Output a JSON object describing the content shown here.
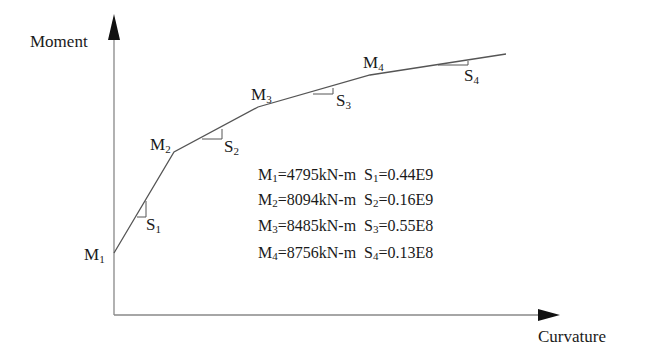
{
  "diagram": {
    "axes": {
      "y_label": "Moment",
      "x_label": "Curvature"
    },
    "points": [
      {
        "id": "M1",
        "label": "M",
        "sub": "1"
      },
      {
        "id": "M2",
        "label": "M",
        "sub": "2"
      },
      {
        "id": "M3",
        "label": "M",
        "sub": "3"
      },
      {
        "id": "M4",
        "label": "M",
        "sub": "4"
      }
    ],
    "slopes": [
      {
        "id": "S1",
        "label": "S",
        "sub": "1"
      },
      {
        "id": "S2",
        "label": "S",
        "sub": "2"
      },
      {
        "id": "S3",
        "label": "S",
        "sub": "3"
      },
      {
        "id": "S4",
        "label": "S",
        "sub": "4"
      }
    ],
    "legend": [
      {
        "m_sub": "1",
        "m_value": "=4795kN-m",
        "s_sub": "1",
        "s_value": "=0.44E9"
      },
      {
        "m_sub": "2",
        "m_value": "=8094kN-m",
        "s_sub": "2",
        "s_value": "=0.16E9"
      },
      {
        "m_sub": "3",
        "m_value": "=8485kN-m",
        "s_sub": "3",
        "s_value": "=0.55E8"
      },
      {
        "m_sub": "4",
        "m_value": "=8756kN-m",
        "s_sub": "4",
        "s_value": "=0.13E8"
      }
    ],
    "legend_prefix_m": "M",
    "legend_prefix_s": "S"
  }
}
